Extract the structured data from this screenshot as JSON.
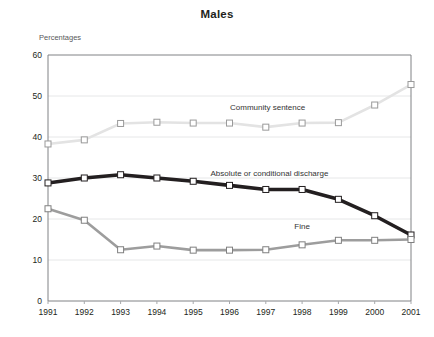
{
  "chart_data": {
    "type": "line",
    "title": "Males",
    "ylabel": "Percentages",
    "xlabel": "",
    "ylim": [
      0,
      60
    ],
    "ytick_step": 10,
    "yticks": [
      "0",
      "10",
      "20",
      "30",
      "40",
      "50",
      "60"
    ],
    "grid": true,
    "legend_position": "inline-labels",
    "categories": [
      "1991",
      "1992",
      "1993",
      "1994",
      "1995",
      "1996",
      "1997",
      "1998",
      "1999",
      "2000",
      "2001"
    ],
    "series": [
      {
        "name": "Community sentence",
        "color": "#e3e3e3",
        "marker_stroke": "#9a9a9a",
        "label_x": 1997.05,
        "label_y": 46.6,
        "values": [
          38.3,
          39.3,
          43.3,
          43.6,
          43.4,
          43.4,
          42.4,
          43.4,
          43.5,
          47.8,
          52.8
        ]
      },
      {
        "name": "Absolute or conditional discharge",
        "color": "#231f20",
        "marker_stroke": "#231f20",
        "label_x": 1997.1,
        "label_y": 30.4,
        "values": [
          28.8,
          30.0,
          30.8,
          30.0,
          29.2,
          28.2,
          27.2,
          27.2,
          24.8,
          20.8,
          16.1
        ]
      },
      {
        "name": "Fine",
        "color": "#9d9d9d",
        "marker_stroke": "#808080",
        "label_x": 1998.0,
        "label_y": 17.6,
        "values": [
          22.5,
          19.7,
          12.5,
          13.4,
          12.4,
          12.4,
          12.5,
          13.7,
          14.8,
          14.8,
          15.0
        ]
      }
    ],
    "xtick_labels": [
      "1991",
      "1992",
      "1993",
      "1994",
      "1995",
      "1996",
      "1997",
      "1998",
      "1999",
      "2000",
      "2001"
    ]
  },
  "colors": {
    "axis": "#808285",
    "grid": "#e6e7e8",
    "text": "#231f20",
    "muted_text": "#58585a",
    "background": "#ffffff"
  }
}
